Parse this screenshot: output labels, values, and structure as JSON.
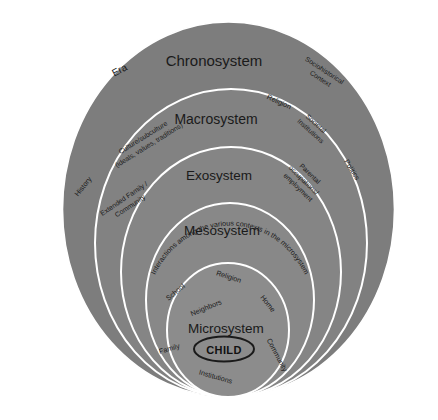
{
  "diagram": {
    "background_color": "#ffffff",
    "ring_fill_color": "#808080",
    "ring_stroke_color": "#ffffff",
    "text_color": "#1a1a1a",
    "center_node": {
      "label": "CHILD",
      "shape": "ellipse"
    },
    "rings": [
      {
        "id": "chronosystem",
        "heading": "Chronosystem",
        "heading_font_size": 15,
        "fill": "#7d7d7d",
        "satellites": [
          {
            "label": "Era",
            "rotation": -28
          },
          {
            "label": "Sociohistorical Context",
            "lines": [
              "Sociohistorical",
              "Context"
            ],
            "rotation": 33
          }
        ]
      },
      {
        "id": "macrosystem",
        "heading": "Macrosystem",
        "heading_font_size": 14,
        "fill": "#828282",
        "satellites": [
          {
            "label": "Culture/subculture (ideals, values, traditions)",
            "lines": [
              "Culture/subculture",
              "(ideals, values, traditions)"
            ],
            "rotation": -32
          },
          {
            "label": "Religion",
            "rotation": 25
          },
          {
            "label": "Societal Institutions",
            "lines": [
              "Societal",
              "Institutions"
            ],
            "rotation": 42
          },
          {
            "label": "Politics",
            "rotation": 58
          }
        ]
      },
      {
        "id": "exosystem",
        "heading": "Exosystem",
        "heading_font_size": 13.5,
        "fill": "#858585",
        "satellites": [
          {
            "label": "History",
            "rotation": -52
          },
          {
            "label": "Extended Family / Community",
            "lines": [
              "Extended Family /",
              "Community"
            ],
            "rotation": -34
          },
          {
            "label": "Parental occupations/ employment",
            "lines": [
              "Parental",
              "occupations/",
              "employment"
            ],
            "rotation": 44
          }
        ]
      },
      {
        "id": "mesosystem",
        "heading": "Mesosystem",
        "heading_font_size": 13.5,
        "fill": "#888888",
        "satellites": [
          {
            "label": "Interactions among the various contexts in the microsystem",
            "curved": true
          }
        ]
      },
      {
        "id": "microsystem",
        "heading": "Microsystem",
        "heading_font_size": 13.5,
        "fill": "#8c8c8c",
        "satellites": [
          {
            "label": "School",
            "rotation": -40
          },
          {
            "label": "Religion",
            "rotation": 18
          },
          {
            "label": "Neighbors",
            "rotation": -22
          },
          {
            "label": "Home",
            "rotation": 52
          },
          {
            "label": "Family",
            "rotation": -16
          },
          {
            "label": "Community",
            "rotation": 62
          },
          {
            "label": "Institutions",
            "rotation": 16
          }
        ]
      }
    ]
  }
}
